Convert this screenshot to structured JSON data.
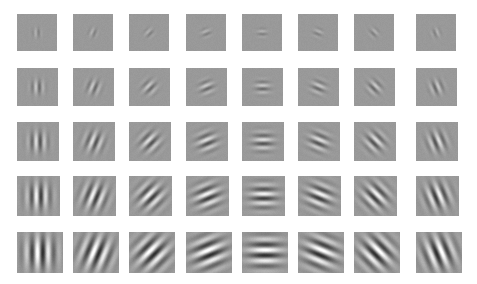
{
  "figure": {
    "background_color": "#ffffff",
    "tile_mean_color": "#999999",
    "width": 477,
    "height": 284,
    "rows": 5,
    "columns": 8
  },
  "chart_data": {
    "type": "heatmap",
    "xlabel": "Orientation (degrees)",
    "ylabel": "Envelope size / contrast level",
    "grid": false,
    "legend": "none",
    "categories": [
      "0",
      "22.5",
      "45",
      "67.5",
      "90",
      "112.5",
      "135",
      "157.5"
    ],
    "row_labels": [
      "Level 1",
      "Level 2",
      "Level 3",
      "Level 4",
      "Level 5"
    ],
    "orientations_deg": [
      0,
      22.5,
      45,
      67.5,
      90,
      112.5,
      135,
      157.5
    ],
    "sigma_px": [
      3.2,
      4.8,
      6.6,
      8.6,
      11.0
    ],
    "contrast": [
      0.25,
      0.45,
      0.65,
      0.85,
      1.0
    ],
    "wavelength_px": [
      6.5,
      7.5,
      8.5,
      9.5,
      11.0
    ],
    "phase_deg": 90,
    "series": [
      {
        "name": "Level 1",
        "values": [
          0.25,
          0.25,
          0.25,
          0.25,
          0.25,
          0.25,
          0.25,
          0.25
        ]
      },
      {
        "name": "Level 2",
        "values": [
          0.45,
          0.45,
          0.45,
          0.45,
          0.45,
          0.45,
          0.45,
          0.45
        ]
      },
      {
        "name": "Level 3",
        "values": [
          0.65,
          0.65,
          0.65,
          0.65,
          0.65,
          0.65,
          0.65,
          0.65
        ]
      },
      {
        "name": "Level 4",
        "values": [
          0.85,
          0.85,
          0.85,
          0.85,
          0.85,
          0.85,
          0.85,
          0.85
        ]
      },
      {
        "name": "Level 5",
        "values": [
          1.0,
          1.0,
          1.0,
          1.0,
          1.0,
          1.0,
          1.0,
          1.0
        ]
      }
    ]
  },
  "layout": {
    "tile_width": 43,
    "tile_height": 38,
    "bottom_tile_width": 46,
    "bottom_tile_height": 41,
    "col_x": [
      17,
      73,
      129,
      186,
      242,
      298,
      354,
      416
    ],
    "row_y": [
      14,
      68,
      122,
      176,
      232
    ],
    "row_tile_w": [
      40,
      41,
      42,
      43,
      46
    ],
    "row_tile_h": [
      37,
      38,
      39,
      40,
      41
    ]
  }
}
